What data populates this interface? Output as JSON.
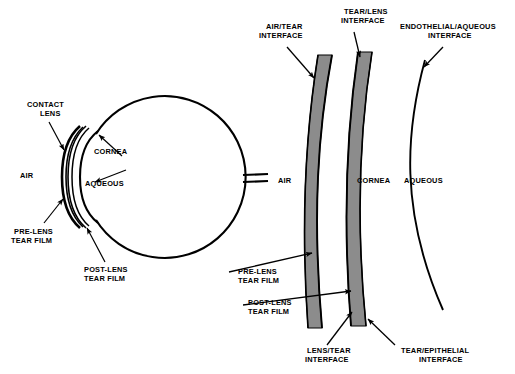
{
  "figure": {
    "equals_symbol": "=",
    "colors": {
      "stroke": "#000000",
      "band_fill": "#8c8c8c",
      "band_fill_dark": "#7d7d7d",
      "background": "#ffffff",
      "vertical_label_text": "#ffffff"
    }
  },
  "left_eye": {
    "labels": {
      "contact_lens_line1": "CONTACT",
      "contact_lens_line2": "LENS",
      "cornea": "CORNEA",
      "aqueous": "AQUEOUS",
      "air": "AIR",
      "pre_lens_tear_film_line1": "PRE-LENS",
      "pre_lens_tear_film_line2": "TEAR FILM",
      "post_lens_tear_film_line1": "POST-LENS",
      "post_lens_tear_film_line2": "TEAR FILM"
    }
  },
  "right_detail": {
    "labels": {
      "air": "AIR",
      "contact_lens": "CONTACT LENS",
      "cornea": "CORNEA",
      "aqueous": "AQUEOUS",
      "air_tear_interface_line1": "AIR/TEAR",
      "air_tear_interface_line2": "INTERFACE",
      "tear_lens_interface_line1": "TEAR/LENS",
      "tear_lens_interface_line2": "INTERFACE",
      "endothelial_aqueous_interface_line1": "ENDOTHELIAL/AQUEOUS",
      "endothelial_aqueous_interface_line2": "INTERFACE",
      "pre_lens_tear_film_line1": "PRE-LENS",
      "pre_lens_tear_film_line2": "TEAR FILM",
      "post_lens_tear_film_line1": "POST-LENS",
      "post_lens_tear_film_line2": "TEAR FILM",
      "lens_tear_interface_line1": "LENS/TEAR",
      "lens_tear_interface_line2": "INTERFACE",
      "tear_epithelial_interface_line1": "TEAR/EPITHELIAL",
      "tear_epithelial_interface_line2": "INTERFACE"
    }
  }
}
